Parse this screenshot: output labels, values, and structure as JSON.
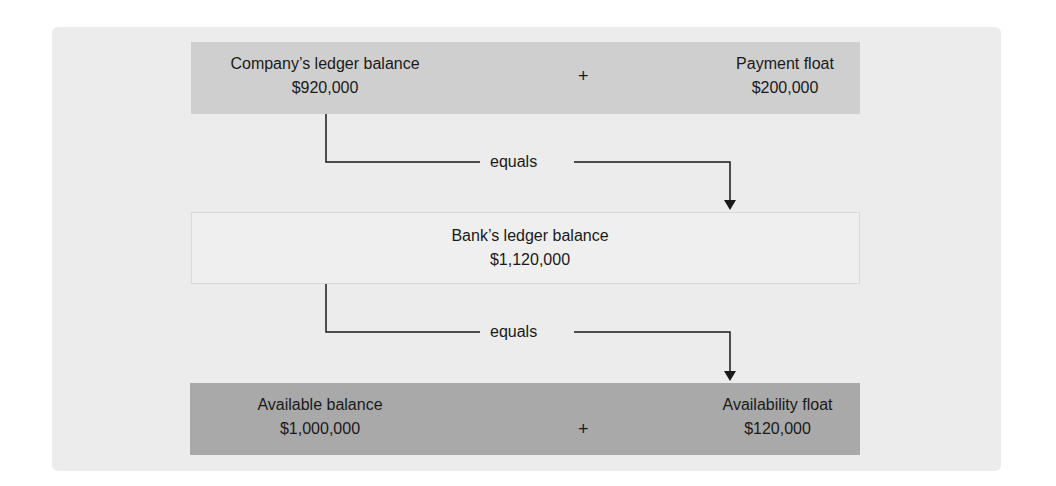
{
  "diagram": {
    "top_row": {
      "left": {
        "label": "Company’s ledger balance",
        "value": "$920,000"
      },
      "operator": "+",
      "right": {
        "label": "Payment float",
        "value": "$200,000"
      }
    },
    "connector_1": {
      "label": "equals"
    },
    "middle_row": {
      "label": "Bank’s ledger balance",
      "value": "$1,120,000"
    },
    "connector_2": {
      "label": "equals"
    },
    "bottom_row": {
      "left": {
        "label": "Available balance",
        "value": "$1,000,000"
      },
      "operator": "+",
      "right": {
        "label": "Availability float",
        "value": "$120,000"
      }
    }
  },
  "colors": {
    "panel": "#ececec",
    "top_box": "#cfcfcf",
    "middle_box": "#efefef",
    "bottom_box": "#a9a9a9",
    "line": "#1a1a1a"
  }
}
